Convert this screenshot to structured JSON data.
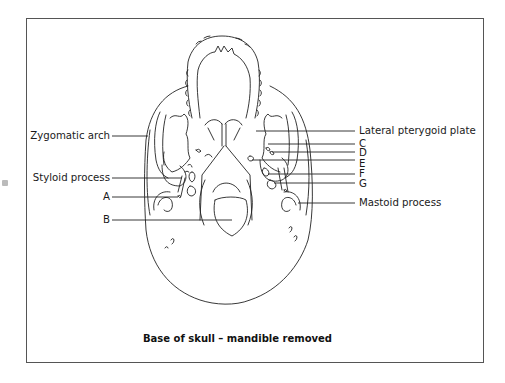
{
  "figure": {
    "title": "Base of skull – mandible removed",
    "labels_left": [
      {
        "id": "zygomatic_arch",
        "text": "Zygomatic arch"
      },
      {
        "id": "styloid_process",
        "text": "Styloid process"
      },
      {
        "id": "A",
        "text": "A"
      },
      {
        "id": "B",
        "text": "B"
      }
    ],
    "labels_right": [
      {
        "id": "lateral_pterygoid_plate",
        "text": "Lateral pterygoid plate"
      },
      {
        "id": "C",
        "text": "C"
      },
      {
        "id": "D",
        "text": "D"
      },
      {
        "id": "E",
        "text": "E"
      },
      {
        "id": "F",
        "text": "F"
      },
      {
        "id": "G",
        "text": "G"
      },
      {
        "id": "mastoid_process",
        "text": "Mastoid process"
      }
    ]
  }
}
